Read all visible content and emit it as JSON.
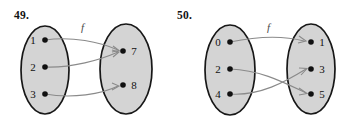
{
  "page": {
    "background": "#ffffff",
    "width": 349,
    "height": 127,
    "kind": "textbook-exercise-figure"
  },
  "style": {
    "oval_fill": "#d4d4d4",
    "oval_stroke": "#171717",
    "dot_color": "#111111",
    "arrow_color": "#8a8a8a",
    "text_color": "#111111",
    "function_label_color": "#4a4a4a"
  },
  "figures": [
    {
      "id": "figure-49",
      "number": "49.",
      "function_label": "f",
      "domain_elements": [
        "1",
        "2",
        "3"
      ],
      "codomain_elements": [
        "7",
        "8"
      ],
      "mappings": [
        {
          "from": "1",
          "to": "7"
        },
        {
          "from": "2",
          "to": "7"
        },
        {
          "from": "3",
          "to": "8"
        }
      ]
    },
    {
      "id": "figure-50",
      "number": "50.",
      "function_label": "f",
      "domain_elements": [
        "0",
        "2",
        "4"
      ],
      "codomain_elements": [
        "1",
        "3",
        "5"
      ],
      "mappings": [
        {
          "from": "0",
          "to": "1"
        },
        {
          "from": "2",
          "to": "5"
        },
        {
          "from": "4",
          "to": "3"
        }
      ]
    }
  ]
}
